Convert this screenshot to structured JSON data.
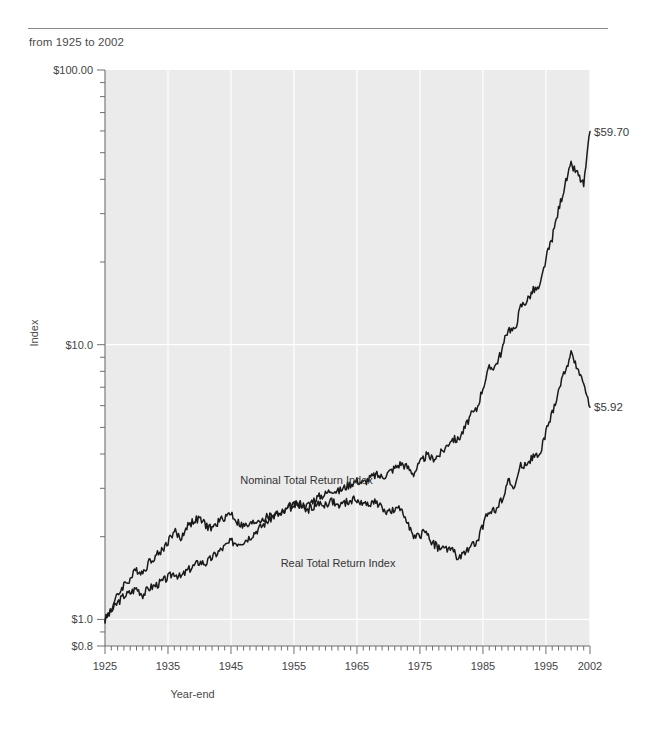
{
  "header": {
    "subtitle": "from 1925 to 2002"
  },
  "chart_data": {
    "type": "line",
    "title": "",
    "subtitle": "from 1925 to 2002",
    "xlabel": "Year-end",
    "ylabel": "Index",
    "yscale": "log",
    "ylim": [
      0.8,
      100.0
    ],
    "xlim": [
      1925,
      2002
    ],
    "grid": true,
    "grid_color": "#ffffff",
    "plot_background": "#ebebeb",
    "line_color": "#1a1a1a",
    "legend_position": "inline-annotations",
    "ytick_labels": [
      "$100.00",
      "$10.0",
      "$1.0",
      "$0.8"
    ],
    "ytick_values": [
      100.0,
      10.0,
      1.0,
      0.8
    ],
    "xtick_labels": [
      "1925",
      "1935",
      "1945",
      "1955",
      "1965",
      "1975",
      "1985",
      "1995",
      "2002"
    ],
    "xtick_values": [
      1925,
      1935,
      1945,
      1955,
      1965,
      1975,
      1985,
      1995,
      2002
    ],
    "annotations": [
      {
        "text": "Nominal Total Return Index",
        "x": 1957,
        "y": 3.1
      },
      {
        "text": "Real Total Return Index",
        "x": 1962,
        "y": 1.55
      }
    ],
    "end_labels": [
      {
        "text": "$59.70",
        "series": "Nominal Total Return Index",
        "value": 59.7
      },
      {
        "text": "$5.92",
        "series": "Real Total Return Index",
        "value": 5.92
      }
    ],
    "series": [
      {
        "name": "Nominal Total Return Index",
        "end_value": 59.7,
        "x": [
          1925,
          1926,
          1927,
          1928,
          1929,
          1930,
          1931,
          1932,
          1933,
          1934,
          1935,
          1936,
          1937,
          1938,
          1939,
          1940,
          1941,
          1942,
          1943,
          1944,
          1945,
          1946,
          1947,
          1948,
          1949,
          1950,
          1951,
          1952,
          1953,
          1954,
          1955,
          1956,
          1957,
          1958,
          1959,
          1960,
          1961,
          1962,
          1963,
          1964,
          1965,
          1966,
          1967,
          1968,
          1969,
          1970,
          1971,
          1972,
          1973,
          1974,
          1975,
          1976,
          1977,
          1978,
          1979,
          1980,
          1981,
          1982,
          1983,
          1984,
          1985,
          1986,
          1987,
          1988,
          1989,
          1990,
          1991,
          1992,
          1993,
          1994,
          1995,
          1996,
          1997,
          1998,
          1999,
          2000,
          2001,
          2002
        ],
        "values": [
          1.0,
          1.07,
          1.15,
          1.22,
          1.25,
          1.3,
          1.23,
          1.3,
          1.33,
          1.37,
          1.42,
          1.48,
          1.42,
          1.5,
          1.56,
          1.62,
          1.6,
          1.68,
          1.76,
          1.84,
          1.92,
          1.9,
          1.93,
          2.0,
          2.1,
          2.2,
          2.3,
          2.4,
          2.42,
          2.52,
          2.6,
          2.64,
          2.58,
          2.72,
          2.8,
          2.86,
          2.98,
          2.92,
          3.02,
          3.12,
          3.2,
          3.14,
          3.26,
          3.36,
          3.3,
          3.42,
          3.56,
          3.7,
          3.58,
          3.4,
          3.7,
          3.95,
          3.85,
          3.95,
          4.2,
          4.55,
          4.5,
          4.9,
          5.5,
          5.8,
          7.0,
          8.2,
          8.4,
          9.5,
          11.5,
          11.2,
          13.8,
          14.5,
          15.8,
          16.0,
          20.5,
          24.5,
          31.0,
          38.0,
          45.0,
          42.0,
          38.0,
          59.7
        ]
      },
      {
        "name": "Real Total Return Index",
        "end_value": 5.92,
        "x": [
          1925,
          1926,
          1927,
          1928,
          1929,
          1930,
          1931,
          1932,
          1933,
          1934,
          1935,
          1936,
          1937,
          1938,
          1939,
          1940,
          1941,
          1942,
          1943,
          1944,
          1945,
          1946,
          1947,
          1948,
          1949,
          1950,
          1951,
          1952,
          1953,
          1954,
          1955,
          1956,
          1957,
          1958,
          1959,
          1960,
          1961,
          1962,
          1963,
          1964,
          1965,
          1966,
          1967,
          1968,
          1969,
          1970,
          1971,
          1972,
          1973,
          1974,
          1975,
          1976,
          1977,
          1978,
          1979,
          1980,
          1981,
          1982,
          1983,
          1984,
          1985,
          1986,
          1987,
          1988,
          1989,
          1990,
          1991,
          1992,
          1993,
          1994,
          1995,
          1996,
          1997,
          1998,
          1999,
          2000,
          2001,
          2002
        ],
        "values": [
          1.0,
          1.1,
          1.22,
          1.34,
          1.4,
          1.52,
          1.48,
          1.62,
          1.7,
          1.78,
          1.92,
          2.1,
          1.96,
          2.18,
          2.28,
          2.32,
          2.2,
          2.14,
          2.26,
          2.36,
          2.44,
          2.26,
          2.18,
          2.2,
          2.28,
          2.32,
          2.36,
          2.44,
          2.44,
          2.56,
          2.62,
          2.6,
          2.48,
          2.58,
          2.62,
          2.62,
          2.7,
          2.58,
          2.64,
          2.7,
          2.74,
          2.6,
          2.66,
          2.68,
          2.52,
          2.46,
          2.48,
          2.52,
          2.3,
          1.96,
          2.02,
          2.1,
          1.9,
          1.82,
          1.8,
          1.82,
          1.66,
          1.72,
          1.86,
          1.88,
          2.2,
          2.5,
          2.48,
          2.74,
          3.2,
          3.0,
          3.6,
          3.7,
          3.92,
          3.9,
          4.8,
          5.6,
          6.8,
          8.0,
          9.2,
          8.3,
          7.2,
          5.92
        ]
      }
    ]
  }
}
